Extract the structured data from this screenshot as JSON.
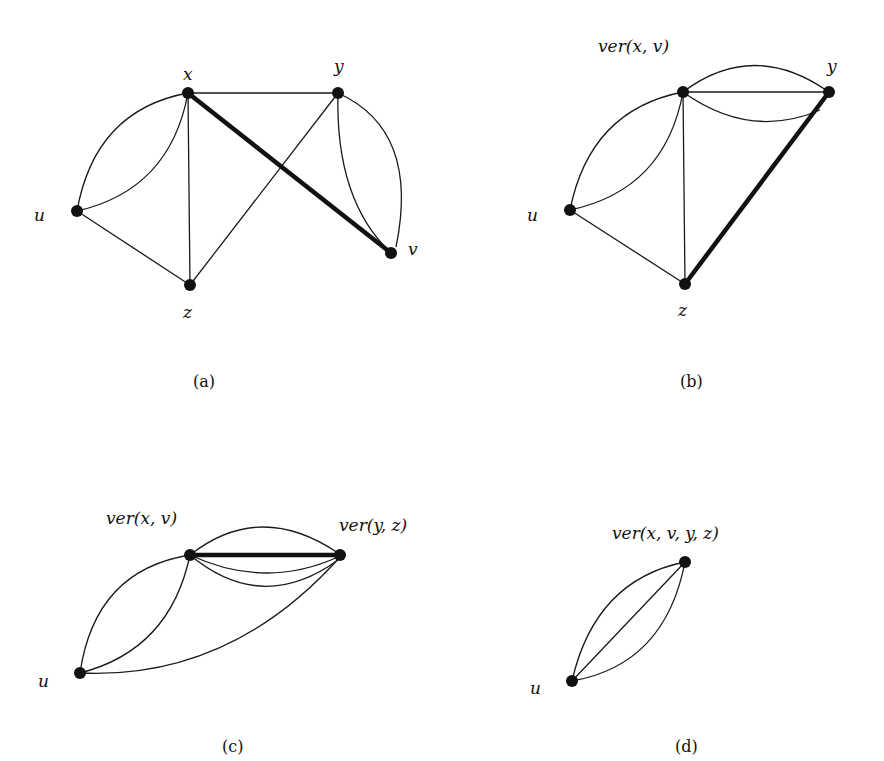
{
  "figure": {
    "panels": [
      {
        "id": "a",
        "caption": "(a)",
        "nodes": [
          {
            "id": "x",
            "label": "x"
          },
          {
            "id": "y",
            "label": "y"
          },
          {
            "id": "u",
            "label": "u"
          },
          {
            "id": "z",
            "label": "z"
          },
          {
            "id": "v",
            "label": "v"
          }
        ],
        "edges": [
          {
            "from": "x",
            "to": "y"
          },
          {
            "from": "x",
            "to": "v",
            "contracted": true
          },
          {
            "from": "x",
            "to": "u",
            "multiplicity": 2
          },
          {
            "from": "x",
            "to": "z"
          },
          {
            "from": "u",
            "to": "z"
          },
          {
            "from": "z",
            "to": "y"
          },
          {
            "from": "y",
            "to": "v",
            "multiplicity": 2
          }
        ]
      },
      {
        "id": "b",
        "caption": "(b)",
        "nodes": [
          {
            "id": "xv",
            "label": "ver(x, v)"
          },
          {
            "id": "y",
            "label": "y"
          },
          {
            "id": "u",
            "label": "u"
          },
          {
            "id": "z",
            "label": "z"
          }
        ],
        "edges": [
          {
            "from": "xv",
            "to": "y",
            "multiplicity": 3
          },
          {
            "from": "xv",
            "to": "u",
            "multiplicity": 2
          },
          {
            "from": "xv",
            "to": "z"
          },
          {
            "from": "u",
            "to": "z"
          },
          {
            "from": "z",
            "to": "y",
            "contracted": true
          }
        ]
      },
      {
        "id": "c",
        "caption": "(c)",
        "nodes": [
          {
            "id": "xv",
            "label": "ver(x, v)"
          },
          {
            "id": "yz",
            "label": "ver(y, z)"
          },
          {
            "id": "u",
            "label": "u"
          }
        ],
        "edges": [
          {
            "from": "xv",
            "to": "yz",
            "multiplicity": 4,
            "contracted": true
          },
          {
            "from": "xv",
            "to": "u",
            "multiplicity": 2
          },
          {
            "from": "u",
            "to": "yz"
          }
        ]
      },
      {
        "id": "d",
        "caption": "(d)",
        "nodes": [
          {
            "id": "xvyz",
            "label": "ver(x, v, y, z)"
          },
          {
            "id": "u",
            "label": "u"
          }
        ],
        "edges": [
          {
            "from": "u",
            "to": "xvyz",
            "multiplicity": 3
          }
        ]
      }
    ]
  },
  "labels": {
    "a": {
      "x": "x",
      "y": "y",
      "u": "u",
      "z": "z",
      "v": "v",
      "caption": "(a)"
    },
    "b": {
      "xv": "ver(x, v)",
      "y": "y",
      "u": "u",
      "z": "z",
      "caption": "(b)"
    },
    "c": {
      "xv": "ver(x, v)",
      "yz": "ver(y, z)",
      "u": "u",
      "caption": "(c)"
    },
    "d": {
      "xvyz": "ver(x, v, y, z)",
      "u": "u",
      "caption": "(d)"
    }
  }
}
